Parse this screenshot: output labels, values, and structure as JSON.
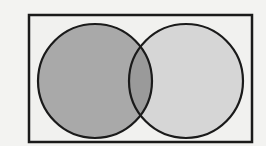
{
  "diagram": {
    "type": "venn",
    "sets": [
      {
        "name": "A",
        "shaded": true,
        "fill": "#a9a9a9"
      },
      {
        "name": "B",
        "shaded": false,
        "fill": "#d6d6d6"
      }
    ],
    "intersection": {
      "fill": "#9a9a9a"
    },
    "universe": {
      "fill": "#f1f1ef"
    },
    "stroke": "#1a1a1a",
    "labels": []
  }
}
